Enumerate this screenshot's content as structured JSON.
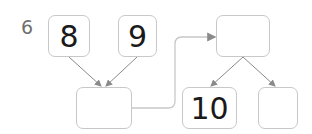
{
  "question": {
    "number": "6"
  },
  "boxes": {
    "top_left": {
      "value": "8"
    },
    "top_middle": {
      "value": "9"
    },
    "sum": {
      "value": ""
    },
    "top_right": {
      "value": ""
    },
    "bottom_middle": {
      "value": "10"
    },
    "bottom_right": {
      "value": ""
    }
  },
  "colors": {
    "border": "#c8c8c8",
    "arrow": "#8a8a8a",
    "text": "#1a1a1a",
    "question_number": "#707070"
  }
}
